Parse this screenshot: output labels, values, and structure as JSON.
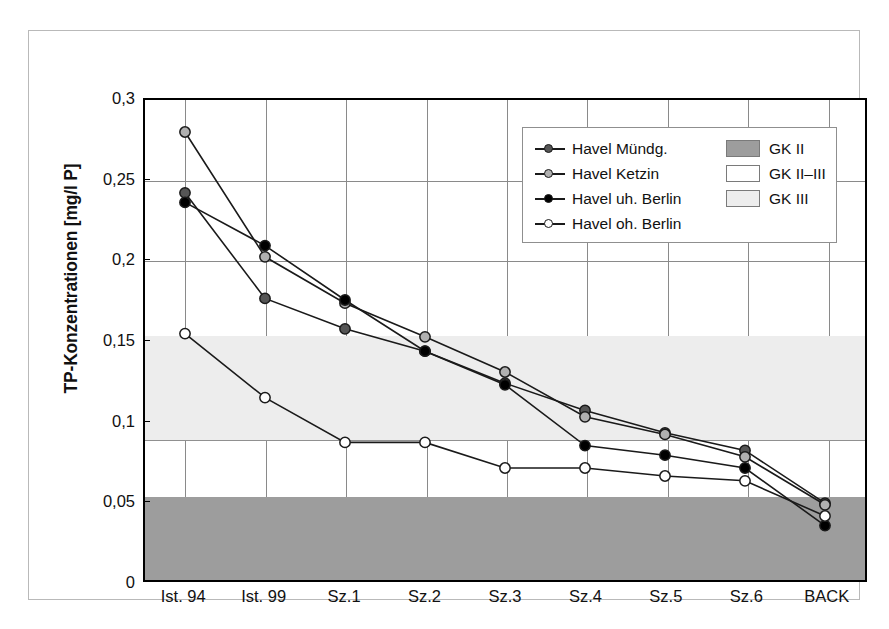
{
  "chart_data": {
    "type": "line",
    "title": "",
    "xlabel": "",
    "ylabel": "TP-Konzentrationen [mg/l P]",
    "categories": [
      "Ist. 94",
      "Ist. 99",
      "Sz.1",
      "Sz.2",
      "Sz.3",
      "Sz.4",
      "Sz.5",
      "Sz.6",
      "BACK"
    ],
    "ylim": [
      0,
      0.3
    ],
    "yticks": [
      "0",
      "0,05",
      "0,1",
      "0,15",
      "0,2",
      "0,25",
      "0,3"
    ],
    "ytick_values": [
      0,
      0.05,
      0.1,
      0.15,
      0.2,
      0.25,
      0.3
    ],
    "grid": "both",
    "legend_position": "top-right",
    "series": [
      {
        "name": "Havel Mündg.",
        "marker": "filled-dark-gray-circle",
        "color": "#555555",
        "values": [
          0.242,
          0.176,
          0.157,
          0.143,
          0.123,
          0.106,
          0.092,
          0.081,
          0.048
        ]
      },
      {
        "name": "Havel Ketzin",
        "marker": "filled-light-gray-circle",
        "color": "#b0b0b0",
        "values": [
          0.28,
          0.202,
          0.173,
          0.152,
          0.13,
          0.102,
          0.091,
          0.077,
          0.047
        ]
      },
      {
        "name": "Havel uh. Berlin",
        "marker": "filled-black-circle",
        "color": "#000000",
        "values": [
          0.236,
          0.209,
          0.175,
          0.143,
          0.122,
          0.084,
          0.078,
          0.07,
          0.034
        ]
      },
      {
        "name": "Havel oh. Berlin",
        "marker": "open-white-circle",
        "color": "#ffffff",
        "values": [
          0.154,
          0.114,
          0.086,
          0.086,
          0.07,
          0.07,
          0.065,
          0.062,
          0.04
        ]
      }
    ],
    "bands": [
      {
        "name": "GK II",
        "from": 0,
        "to": 0.054,
        "color": "#9d9d9d"
      },
      {
        "name": "GK II–III",
        "from": 0.054,
        "to": 0.089,
        "color": "#ffffff"
      },
      {
        "name": "GK III",
        "from": 0.089,
        "to": 0.154,
        "color": "#ededed"
      }
    ]
  },
  "legend": {
    "series": [
      {
        "label": "Havel Mündg."
      },
      {
        "label": "Havel Ketzin"
      },
      {
        "label": "Havel uh. Berlin"
      },
      {
        "label": "Havel oh. Berlin"
      }
    ],
    "bands": [
      {
        "label": "GK II"
      },
      {
        "label": "GK II–III"
      },
      {
        "label": "GK III"
      }
    ]
  }
}
